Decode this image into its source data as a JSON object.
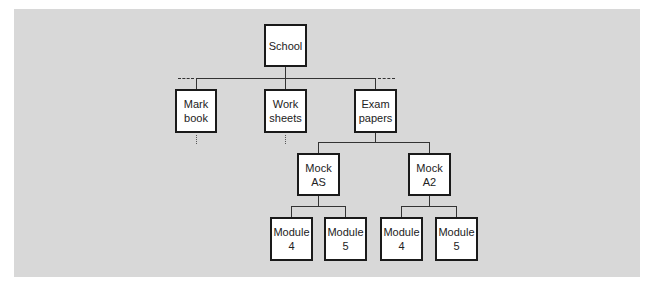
{
  "diagram": {
    "type": "tree",
    "background_color": "#d8d8d8",
    "root": {
      "id": "school",
      "label_lines": [
        "School"
      ],
      "children": [
        {
          "id": "mark-book",
          "label_lines": [
            "Mark",
            "book"
          ],
          "continues": true
        },
        {
          "id": "work-sheets",
          "label_lines": [
            "Work",
            "sheets"
          ],
          "continues": true
        },
        {
          "id": "exam-papers",
          "label_lines": [
            "Exam",
            "papers"
          ],
          "children": [
            {
              "id": "mock-as",
              "label_lines": [
                "Mock",
                "AS"
              ],
              "children": [
                {
                  "id": "mock-as-module-4",
                  "label_lines": [
                    "Module",
                    "4"
                  ]
                },
                {
                  "id": "mock-as-module-5",
                  "label_lines": [
                    "Module",
                    "5"
                  ]
                }
              ]
            },
            {
              "id": "mock-a2",
              "label_lines": [
                "Mock",
                "A2"
              ],
              "children": [
                {
                  "id": "mock-a2-module-4",
                  "label_lines": [
                    "Module",
                    "4"
                  ]
                },
                {
                  "id": "mock-a2-module-5",
                  "label_lines": [
                    "Module",
                    "5"
                  ]
                }
              ]
            }
          ]
        }
      ]
    },
    "nodes": {
      "school": {
        "l1": "School",
        "l2": ""
      },
      "mark_book": {
        "l1": "Mark",
        "l2": "book"
      },
      "work_sheets": {
        "l1": "Work",
        "l2": "sheets"
      },
      "exam_papers": {
        "l1": "Exam",
        "l2": "papers"
      },
      "mock_as": {
        "l1": "Mock",
        "l2": "AS"
      },
      "mock_a2": {
        "l1": "Mock",
        "l2": "A2"
      },
      "as_m4": {
        "l1": "Module",
        "l2": "4"
      },
      "as_m5": {
        "l1": "Module",
        "l2": "5"
      },
      "a2_m4": {
        "l1": "Module",
        "l2": "4"
      },
      "a2_m5": {
        "l1": "Module",
        "l2": "5"
      }
    }
  }
}
